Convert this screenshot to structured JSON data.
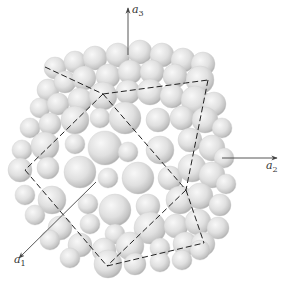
{
  "diagram": {
    "title": "",
    "colors": {
      "background": "#ffffff",
      "sphere_light": "#f4f4f4",
      "sphere_mid": "#d8d8d8",
      "sphere_dark": "#9a9a9a",
      "axis": "#444444",
      "dashed_line": "#222222"
    },
    "axes": [
      {
        "id": "a1",
        "symbol": "a",
        "subscript": "1",
        "from": [
          96,
          182
        ],
        "to": [
          19,
          258
        ],
        "label_pos": [
          14,
          255
        ]
      },
      {
        "id": "a2",
        "symbol": "a",
        "subscript": "2",
        "from": [
          222,
          158
        ],
        "to": [
          277,
          158
        ],
        "label_pos": [
          265,
          163
        ]
      },
      {
        "id": "a3",
        "symbol": "a",
        "subscript": "3",
        "from": [
          128,
          55
        ],
        "to": [
          128,
          8
        ],
        "label_pos": [
          132,
          6
        ]
      }
    ],
    "dashed_lines": [
      {
        "from": [
          45,
          67
        ],
        "to": [
          103,
          94
        ]
      },
      {
        "from": [
          103,
          94
        ],
        "to": [
          208,
          80
        ]
      },
      {
        "from": [
          208,
          80
        ],
        "to": [
          186,
          190
        ]
      },
      {
        "from": [
          186,
          190
        ],
        "to": [
          204,
          243
        ]
      },
      {
        "from": [
          103,
          94
        ],
        "to": [
          25,
          170
        ]
      },
      {
        "from": [
          25,
          170
        ],
        "to": [
          107,
          266
        ]
      },
      {
        "from": [
          107,
          266
        ],
        "to": [
          204,
          243
        ]
      },
      {
        "from": [
          103,
          94
        ],
        "to": [
          186,
          190
        ]
      },
      {
        "from": [
          186,
          190
        ],
        "to": [
          107,
          266
        ]
      }
    ],
    "spheres": [
      [
        55,
        68,
        11
      ],
      [
        75,
        62,
        11
      ],
      [
        95,
        58,
        12
      ],
      [
        118,
        55,
        12
      ],
      [
        140,
        52,
        12
      ],
      [
        162,
        55,
        12
      ],
      [
        183,
        60,
        12
      ],
      [
        203,
        64,
        12
      ],
      [
        48,
        90,
        11
      ],
      [
        65,
        82,
        11
      ],
      [
        84,
        78,
        12
      ],
      [
        108,
        76,
        12
      ],
      [
        130,
        72,
        12
      ],
      [
        152,
        72,
        12
      ],
      [
        175,
        76,
        12
      ],
      [
        200,
        80,
        14
      ],
      [
        40,
        108,
        10
      ],
      [
        58,
        104,
        11
      ],
      [
        80,
        100,
        12
      ],
      [
        103,
        96,
        14
      ],
      [
        128,
        92,
        12
      ],
      [
        150,
        92,
        13
      ],
      [
        172,
        96,
        12
      ],
      [
        195,
        100,
        14
      ],
      [
        214,
        104,
        12
      ],
      [
        30,
        128,
        10
      ],
      [
        50,
        124,
        11
      ],
      [
        75,
        120,
        14
      ],
      [
        100,
        118,
        10
      ],
      [
        125,
        118,
        16
      ],
      [
        158,
        120,
        12
      ],
      [
        182,
        118,
        12
      ],
      [
        205,
        120,
        13
      ],
      [
        222,
        128,
        10
      ],
      [
        22,
        150,
        10
      ],
      [
        45,
        146,
        14
      ],
      [
        75,
        144,
        10
      ],
      [
        105,
        148,
        17
      ],
      [
        128,
        152,
        10
      ],
      [
        160,
        150,
        14
      ],
      [
        190,
        140,
        12
      ],
      [
        212,
        148,
        13
      ],
      [
        224,
        158,
        10
      ],
      [
        20,
        170,
        12
      ],
      [
        48,
        168,
        11
      ],
      [
        80,
        172,
        16
      ],
      [
        108,
        178,
        10
      ],
      [
        138,
        178,
        16
      ],
      [
        170,
        178,
        12
      ],
      [
        192,
        168,
        14
      ],
      [
        212,
        175,
        13
      ],
      [
        226,
        184,
        10
      ],
      [
        25,
        195,
        10
      ],
      [
        52,
        200,
        14
      ],
      [
        88,
        204,
        10
      ],
      [
        115,
        210,
        16
      ],
      [
        148,
        206,
        12
      ],
      [
        180,
        200,
        14
      ],
      [
        200,
        196,
        13
      ],
      [
        220,
        205,
        11
      ],
      [
        35,
        215,
        10
      ],
      [
        60,
        228,
        12
      ],
      [
        90,
        224,
        10
      ],
      [
        115,
        234,
        10
      ],
      [
        150,
        228,
        16
      ],
      [
        176,
        226,
        12
      ],
      [
        198,
        222,
        13
      ],
      [
        218,
        228,
        11
      ],
      [
        50,
        240,
        10
      ],
      [
        80,
        245,
        12
      ],
      [
        104,
        250,
        12
      ],
      [
        130,
        246,
        14
      ],
      [
        160,
        248,
        10
      ],
      [
        185,
        244,
        12
      ],
      [
        203,
        244,
        12
      ],
      [
        70,
        258,
        10
      ],
      [
        108,
        264,
        14
      ],
      [
        135,
        264,
        11
      ],
      [
        160,
        262,
        10
      ],
      [
        182,
        260,
        10
      ],
      [
        200,
        250,
        10
      ]
    ]
  }
}
